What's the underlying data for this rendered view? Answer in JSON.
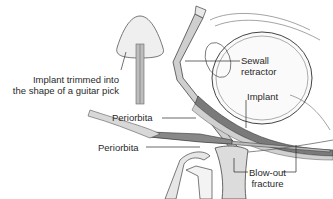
{
  "diagram": {
    "labels": {
      "implant_trimmed_line1": "Implant trimmed into",
      "implant_trimmed_line2": "the shape of a guitar pick",
      "sewall_line1": "Sewall",
      "sewall_line2": "retractor",
      "implant": "Implant",
      "periorbita_upper": "Periorbita",
      "periorbita_lower": "Periorbita",
      "blowout_line1": "Blow-out",
      "blowout_line2": "fracture"
    },
    "colors": {
      "line": "#3a3a3a",
      "tissue_fill": "#e6e6e6",
      "dark_fill": "#7a7a7a",
      "bone_fill": "#d9d9d9"
    }
  }
}
